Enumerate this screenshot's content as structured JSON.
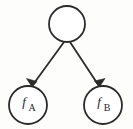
{
  "figure": {
    "background_color": "#fdfdfc",
    "stroke_color": "#2b2b2b",
    "width": 133,
    "height": 129
  },
  "nodes": [
    {
      "id": "root",
      "label_main": "",
      "label_sub": "",
      "cx": 67,
      "cy": 24,
      "r": 18,
      "stroke_width": 1.8
    },
    {
      "id": "leaf-a",
      "label_main": "f",
      "label_sub": "A",
      "cx": 28,
      "cy": 105,
      "r": 19,
      "stroke_width": 1.8
    },
    {
      "id": "leaf-b",
      "label_main": "f",
      "label_sub": "B",
      "cx": 103,
      "cy": 105,
      "r": 19,
      "stroke_width": 1.8
    }
  ],
  "edges": [
    {
      "id": "edge-root-to-a",
      "from": "root",
      "to": "leaf-a",
      "x1": 64,
      "y1": 42,
      "x2": 32,
      "y2": 86,
      "stroke_width": 1.8,
      "arrow_points": "32,87 26.5,78.5 37,81.5"
    },
    {
      "id": "edge-root-to-b",
      "from": "root",
      "to": "leaf-b",
      "x1": 70,
      "y1": 42,
      "x2": 99,
      "y2": 86,
      "stroke_width": 1.8,
      "arrow_points": "99.5,87 94.5,81 105,78.5"
    }
  ]
}
